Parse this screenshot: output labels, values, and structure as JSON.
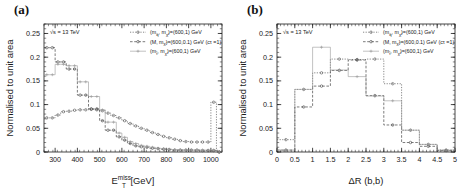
{
  "figure": {
    "panels": [
      {
        "label": "(a)",
        "cme": "√s = 13 TeV",
        "ylabel": "Normalised to unit area",
        "xlabel_main": "E",
        "xlabel_sub": "T",
        "xlabel_sup": "miss",
        "xlabel_unit": "[GeV]",
        "legend": [
          {
            "base1": "(m",
            "sub1": "q̃",
            "base2": ", m",
            "sub2": "χ̃",
            "tail": ")=(600,1) GeV",
            "extra": ""
          },
          {
            "base1": "(M, m",
            "sub1": "",
            "base2": "",
            "sub2": "χ̃",
            "tail": ")=(600,0.1) GeV",
            "extra": "(cτ =1)"
          },
          {
            "base1": "(m",
            "sub1": "t̃",
            "base2": ", m",
            "sub2": "χ̃",
            "tail": ")=(600,1) GeV",
            "extra": ""
          }
        ]
      },
      {
        "label": "(b)",
        "cme": "√s = 13 TeV",
        "ylabel": "Normalised to unit area",
        "xlabel_main": "ΔR (b,b)",
        "xlabel_sub": "",
        "xlabel_sup": "",
        "xlabel_unit": "",
        "legend": [
          {
            "base1": "(m",
            "sub1": "q̃",
            "base2": ", m",
            "sub2": "χ̃",
            "tail": ")=(600,1) GeV",
            "extra": ""
          },
          {
            "base1": "(M, m",
            "sub1": "",
            "base2": "",
            "sub2": "χ̃",
            "tail": ")=(600,0.1) GeV",
            "extra": "(cτ =1)"
          },
          {
            "base1": "(m",
            "sub1": "t̃",
            "base2": ", m",
            "sub2": "χ̃",
            "tail": ")=(600,1) GeV",
            "extra": ""
          }
        ]
      }
    ]
  },
  "chart_data": [
    {
      "type": "line",
      "panel": "(a)",
      "title": "",
      "xlabel": "E_T^miss [GeV]",
      "ylabel": "Normalised to unit area",
      "xlim": [
        250,
        1050
      ],
      "ylim": [
        0,
        0.27
      ],
      "xticks": [
        300,
        400,
        500,
        600,
        700,
        800,
        900,
        1000
      ],
      "yticks": [
        0,
        0.05,
        0.1,
        0.15,
        0.2,
        0.25
      ],
      "grid": false,
      "legend_position": "top-right",
      "bin_edges": [
        250,
        275,
        300,
        325,
        350,
        375,
        400,
        425,
        450,
        475,
        500,
        525,
        550,
        575,
        600,
        625,
        650,
        675,
        700,
        725,
        750,
        775,
        800,
        825,
        850,
        875,
        900,
        925,
        950,
        975,
        1000,
        1025,
        1050
      ],
      "series": [
        {
          "name": "(m_q, m_chi)=(600,1) GeV",
          "color": "#555555",
          "dash": "dotted",
          "marker": "circle",
          "values": [
            0.072,
            0.072,
            0.078,
            0.085,
            0.086,
            0.088,
            0.089,
            0.089,
            0.09,
            0.089,
            0.087,
            0.082,
            0.077,
            0.072,
            0.066,
            0.06,
            0.055,
            0.05,
            0.046,
            0.041,
            0.037,
            0.033,
            0.03,
            0.027,
            0.024,
            0.022,
            0.021,
            0.021,
            0.021,
            0.021,
            0.105,
            0.0
          ]
        },
        {
          "name": "(M, m_chi)=(600,0.1) GeV (ctau=1)",
          "color": "#444444",
          "dash": "dashed",
          "marker": "circle",
          "values": [
            0.22,
            0.22,
            0.19,
            0.19,
            0.175,
            0.175,
            0.12,
            0.12,
            0.091,
            0.091,
            0.066,
            0.046,
            0.046,
            0.032,
            0.025,
            0.018,
            0.013,
            0.011,
            0.01,
            0.008,
            0.007,
            0.006,
            0.005,
            0.004,
            0.004,
            0.004,
            0.004,
            0.004,
            0.003,
            0.003,
            0.003,
            0.0
          ]
        },
        {
          "name": "(m_t, m_chi)=(600,1) GeV",
          "color": "#999999",
          "dash": "solid-thin",
          "marker": "cross",
          "values": [
            0.163,
            0.163,
            0.185,
            0.185,
            0.182,
            0.182,
            0.148,
            0.148,
            0.117,
            0.117,
            0.089,
            0.063,
            0.063,
            0.04,
            0.031,
            0.022,
            0.018,
            0.014,
            0.012,
            0.01,
            0.008,
            0.007,
            0.006,
            0.005,
            0.005,
            0.004,
            0.004,
            0.004,
            0.004,
            0.004,
            0.004,
            0.0
          ]
        }
      ]
    },
    {
      "type": "line",
      "panel": "(b)",
      "title": "",
      "xlabel": "ΔR (b,b)",
      "ylabel": "Normalised to unit area",
      "xlim": [
        0,
        5
      ],
      "ylim": [
        0,
        0.27
      ],
      "xticks": [
        0,
        0.5,
        1,
        1.5,
        2,
        2.5,
        3,
        3.5,
        4,
        4.5,
        5
      ],
      "yticks": [
        0,
        0.05,
        0.1,
        0.15,
        0.2,
        0.25
      ],
      "grid": false,
      "legend_position": "top-right",
      "bin_edges": [
        0,
        0.5,
        1.0,
        1.5,
        2.0,
        2.5,
        3.0,
        3.5,
        4.0,
        4.5,
        5.0
      ],
      "series": [
        {
          "name": "(m_q, m_chi)=(600,1) GeV",
          "color": "#555555",
          "dash": "dotted",
          "marker": "circle",
          "values": [
            0.026,
            0.132,
            0.167,
            0.196,
            0.195,
            0.196,
            0.144,
            0.046,
            0.016,
            0.004
          ]
        },
        {
          "name": "(M, m_chi)=(600,0.1) GeV (ctau=1)",
          "color": "#444444",
          "dash": "dashed",
          "marker": "circle",
          "values": [
            0.004,
            0.095,
            0.139,
            0.172,
            0.194,
            0.119,
            0.057,
            0.02,
            0.012,
            0.003
          ]
        },
        {
          "name": "(m_t, m_chi)=(600,1) GeV",
          "color": "#999999",
          "dash": "solid-thin",
          "marker": "cross",
          "values": [
            0.004,
            0.132,
            0.221,
            0.173,
            0.159,
            0.118,
            0.108,
            0.046,
            0.016,
            0.004
          ]
        }
      ]
    }
  ]
}
